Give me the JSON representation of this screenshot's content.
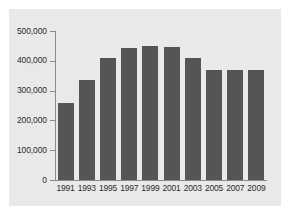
{
  "chart_data": {
    "type": "bar",
    "title": "",
    "subtitle": "",
    "xlabel": "",
    "ylabel": "",
    "categories": [
      "1991",
      "1993",
      "1995",
      "1997",
      "1999",
      "2001",
      "2003",
      "2005",
      "2007",
      "2009"
    ],
    "values": [
      259000,
      337000,
      408000,
      443000,
      450000,
      446000,
      408000,
      370000,
      370000,
      370000
    ],
    "ylim": [
      0,
      500000
    ],
    "y_ticks": [
      0,
      100000,
      200000,
      300000,
      400000,
      500000
    ],
    "y_tick_labels": [
      "0",
      "100,000",
      "200,000",
      "300,000",
      "400,000",
      "500,000"
    ],
    "grid": false,
    "legend": null,
    "legend_position": "none",
    "colors": {
      "bar": "#555555",
      "panel_background": "#e9e9e9",
      "figure_background": "#ffffff",
      "axis_line": "#8a8a8a",
      "tick_label": "#2b2b2b"
    }
  }
}
